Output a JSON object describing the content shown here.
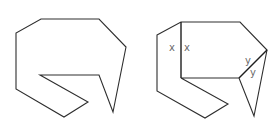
{
  "figure": {
    "left_shape": {
      "points": "41,19 99,19 126,47 113,112 99,75 40,75 88,102 64,117 16,89 16,33"
    },
    "right_shape": {
      "outline_points": "157,35 181,22 240,22 267,50 254,116 239,78 181,78 228,104 205,118 157,91",
      "cut_vertical": {
        "x1": 181,
        "y1": 22,
        "x2": 181,
        "y2": 78
      },
      "cut_diagonal": {
        "x1": 239,
        "y1": 78,
        "x2": 267,
        "y2": 50
      },
      "labels": [
        {
          "text": "x",
          "x": 169,
          "y": 51
        },
        {
          "text": "x",
          "x": 184,
          "y": 51
        },
        {
          "text": "y",
          "x": 245,
          "y": 64
        },
        {
          "text": "y",
          "x": 250,
          "y": 76
        }
      ]
    }
  }
}
